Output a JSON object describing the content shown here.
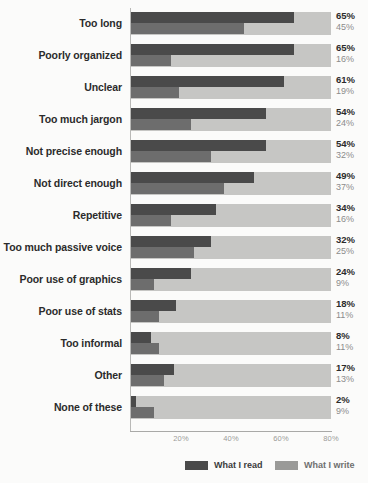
{
  "chart_data": {
    "type": "bar",
    "orientation": "horizontal",
    "title": "",
    "xlabel": "",
    "ylabel": "",
    "xlim": [
      0,
      80
    ],
    "grid": false,
    "legend_position": "bottom",
    "xticks": [
      "20%",
      "40%",
      "60%",
      "80%"
    ],
    "xtick_values": [
      20,
      40,
      60,
      80
    ],
    "categories": [
      "Too long",
      "Poorly organized",
      "Unclear",
      "Too much jargon",
      "Not precise enough",
      "Not direct enough",
      "Repetitive",
      "Too much passive voice",
      "Poor use of graphics",
      "Poor use of stats",
      "Too informal",
      "Other",
      "None of these"
    ],
    "series": [
      {
        "name": "What I read",
        "color": "#4a4a4a",
        "values": [
          65,
          65,
          61,
          54,
          54,
          49,
          34,
          32,
          24,
          18,
          8,
          17,
          2
        ],
        "labels": [
          "65%",
          "65%",
          "61%",
          "54%",
          "54%",
          "49%",
          "34%",
          "32%",
          "24%",
          "18%",
          "8%",
          "17%",
          "2%"
        ]
      },
      {
        "name": "What I write",
        "color": "#6d6d6d",
        "values": [
          45,
          16,
          19,
          24,
          32,
          37,
          16,
          25,
          9,
          11,
          11,
          13,
          9
        ],
        "labels": [
          "45%",
          "16%",
          "19%",
          "24%",
          "32%",
          "37%",
          "16%",
          "25%",
          "9%",
          "11%",
          "11%",
          "13%",
          "9%"
        ]
      }
    ]
  },
  "legend": {
    "read_label": "What I read",
    "write_label": "What I write"
  },
  "colors": {
    "bar_read": "#4a4a4a",
    "bar_write": "#6d6d6d",
    "track": "#c6c6c4",
    "background": "#fbfbfa"
  }
}
